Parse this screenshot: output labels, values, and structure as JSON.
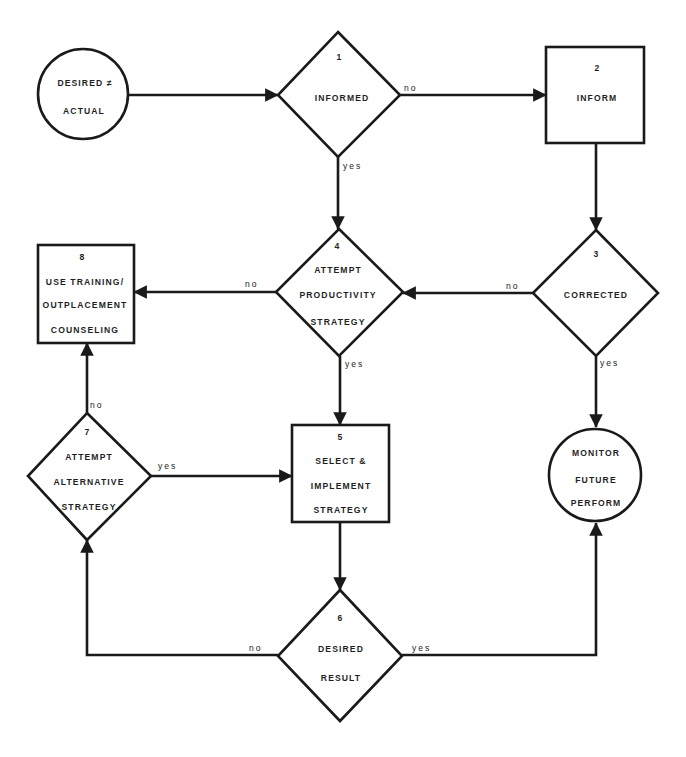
{
  "diagram": {
    "type": "flowchart",
    "colors": {
      "line": "#1a1a1a",
      "background": "#ffffff",
      "text": "#1f1f1f"
    },
    "nodes": {
      "start": {
        "shape": "circle",
        "line1": "DESIRED ≠",
        "line2": "ACTUAL"
      },
      "n1": {
        "shape": "diamond",
        "number": "1",
        "line1": "INFORMED"
      },
      "n2": {
        "shape": "box",
        "number": "2",
        "line1": "INFORM"
      },
      "n3": {
        "shape": "diamond",
        "number": "3",
        "line1": "CORRECTED"
      },
      "n4": {
        "shape": "diamond",
        "number": "4",
        "line1": "ATTEMPT",
        "line2": "PRODUCTIVITY",
        "line3": "STRATEGY"
      },
      "n5": {
        "shape": "box",
        "number": "5",
        "line1": "SELECT  &",
        "line2": "IMPLEMENT",
        "line3": "STRATEGY"
      },
      "n6": {
        "shape": "diamond",
        "number": "6",
        "line1": "DESIRED",
        "line2": "RESULT"
      },
      "n7": {
        "shape": "diamond",
        "number": "7",
        "line1": "ATTEMPT",
        "line2": "ALTERNATIVE",
        "line3": "STRATEGY"
      },
      "n8": {
        "shape": "box",
        "number": "8",
        "line1": "USE TRAINING/",
        "line2": "OUTPLACEMENT",
        "line3": "COUNSELING"
      },
      "end": {
        "shape": "circle",
        "line1": "MONITOR",
        "line2": "FUTURE",
        "line3": "PERFORM"
      }
    },
    "edges": [
      {
        "from": "start",
        "to": "n1",
        "label": ""
      },
      {
        "from": "n1",
        "to": "n2",
        "label": "no"
      },
      {
        "from": "n1",
        "to": "n4",
        "label": "yes"
      },
      {
        "from": "n2",
        "to": "n3",
        "label": ""
      },
      {
        "from": "n3",
        "to": "n4",
        "label": "no"
      },
      {
        "from": "n3",
        "to": "end",
        "label": "yes"
      },
      {
        "from": "n4",
        "to": "n8",
        "label": "no"
      },
      {
        "from": "n4",
        "to": "n5",
        "label": "yes"
      },
      {
        "from": "n7",
        "to": "n8",
        "label": "no"
      },
      {
        "from": "n7",
        "to": "n5",
        "label": "yes"
      },
      {
        "from": "n5",
        "to": "n6",
        "label": ""
      },
      {
        "from": "n6",
        "to": "n7",
        "label": "no"
      },
      {
        "from": "n6",
        "to": "end",
        "label": "yes"
      }
    ]
  }
}
